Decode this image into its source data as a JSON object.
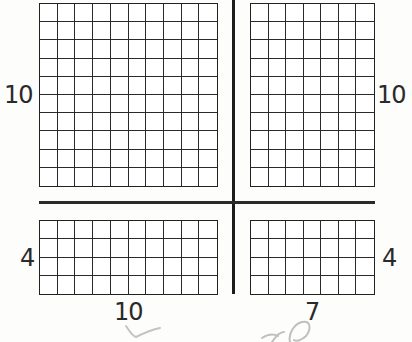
{
  "diagram": {
    "type": "area-model",
    "grids": [
      {
        "id": "top-left",
        "rows": 10,
        "cols": 10,
        "left_label": "10",
        "right_label": "",
        "bottom_label": ""
      },
      {
        "id": "top-right",
        "rows": 10,
        "cols": 7,
        "left_label": "",
        "right_label": "10",
        "bottom_label": ""
      },
      {
        "id": "bottom-left",
        "rows": 4,
        "cols": 10,
        "left_label": "4",
        "right_label": "",
        "bottom_label": "10"
      },
      {
        "id": "bottom-right",
        "rows": 4,
        "cols": 7,
        "left_label": "",
        "right_label": "4",
        "bottom_label": "7"
      }
    ],
    "labels": {
      "top_left_side": "10",
      "top_right_side": "10",
      "bottom_left_side": "4",
      "bottom_right_side": "4",
      "bottom_left_width": "10",
      "bottom_right_width": "7"
    },
    "handwriting": {
      "checkmark": "✓",
      "scribble": "70"
    },
    "colors": {
      "ink": "#222222",
      "pencil": "#b8b8b8",
      "paper": "#fdfdfb"
    }
  }
}
